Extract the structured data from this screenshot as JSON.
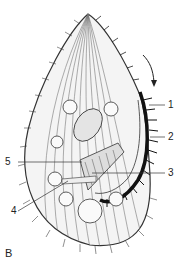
{
  "figure": {
    "panel_label": "B",
    "labels": [
      {
        "id": "1",
        "text": "1"
      },
      {
        "id": "2",
        "text": "2"
      },
      {
        "id": "3",
        "text": "3"
      },
      {
        "id": "4",
        "text": "4"
      },
      {
        "id": "5",
        "text": "5"
      }
    ],
    "arrow": "rotation-direction-arrow"
  }
}
